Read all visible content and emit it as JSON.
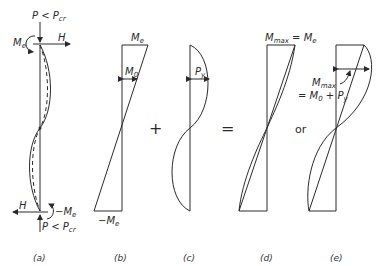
{
  "diagram": {
    "panels": [
      {
        "id": "a",
        "caption": "(a)",
        "labels": {
          "top_load": "P < P",
          "top_load_sub": "cr",
          "top_moment": "M",
          "top_moment_sub": "e",
          "top_shear": "H",
          "bottom_shear": "H",
          "bottom_moment": "−M",
          "bottom_moment_sub": "e",
          "bottom_load": "P < P",
          "bottom_load_sub": "cr"
        }
      },
      {
        "id": "b",
        "caption": "(b)",
        "labels": {
          "top": "M",
          "top_sub": "e",
          "mid": "M",
          "mid_sub": "0",
          "bottom": "−M",
          "bottom_sub": "e"
        }
      },
      {
        "id": "c",
        "caption": "(c)",
        "labels": {
          "mid": "P",
          "mid_sub": "y"
        }
      },
      {
        "id": "d",
        "caption": "(d)",
        "labels": {
          "top": "M",
          "top_sub1": "max",
          "top_eq": " = M",
          "top_sub2": "e"
        }
      },
      {
        "id": "e",
        "caption": "(e)",
        "labels": {
          "mmax": "M",
          "mmax_sub": "max",
          "eq": "= M",
          "eq_sub": "0",
          "plus": " + P",
          "plus_sub": "y"
        }
      }
    ],
    "operators": {
      "plus": "+",
      "equals": "=",
      "or": "or"
    }
  }
}
